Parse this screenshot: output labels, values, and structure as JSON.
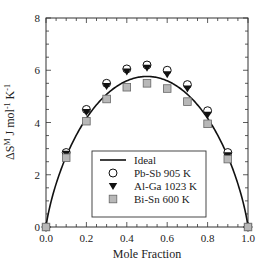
{
  "chart_data": {
    "type": "scatter",
    "title": "",
    "xlabel": "Mole Fraction",
    "ylabel": "ΔS^M J mol^-1 K^-1",
    "ylabel_parts": {
      "delta_s": "ΔS",
      "sup_m": "M",
      "unit": " J mol",
      "sup_1": "-1",
      "unit_k": " K",
      "sup_2": "-1"
    },
    "xlim": [
      0.0,
      1.0
    ],
    "ylim": [
      0,
      8
    ],
    "x_ticks": [
      "0.0",
      "0.2",
      "0.4",
      "0.6",
      "0.8",
      "1.0"
    ],
    "y_ticks": [
      "0",
      "2",
      "4",
      "6",
      "8"
    ],
    "grid": false,
    "legend_position": "lower center (inside)",
    "x": [
      0.0,
      0.1,
      0.2,
      0.3,
      0.4,
      0.5,
      0.6,
      0.7,
      0.8,
      0.9,
      1.0
    ],
    "series": [
      {
        "name": "Ideal",
        "type": "line",
        "formula": "-R[x ln x + (1-x) ln(1-x)]",
        "color": "#111111"
      },
      {
        "name": "Pb-Sb 905 K",
        "marker": "open-circle",
        "values": [
          0.0,
          2.85,
          4.5,
          5.5,
          6.05,
          6.2,
          6.0,
          5.45,
          4.45,
          2.85,
          0.0
        ]
      },
      {
        "name": "Al-Ga 1023 K",
        "marker": "filled-down-triangle",
        "values": [
          0.0,
          2.8,
          4.4,
          5.4,
          5.95,
          6.1,
          5.85,
          5.3,
          4.3,
          2.75,
          0.0
        ]
      },
      {
        "name": "Bi-Sn 600 K",
        "marker": "gray-square",
        "values": [
          0.0,
          2.65,
          4.05,
          4.9,
          5.35,
          5.5,
          5.3,
          4.8,
          3.95,
          2.6,
          0.0
        ]
      }
    ]
  },
  "legend": {
    "items": [
      "Ideal",
      "Pb-Sb 905 K",
      "Al-Ga 1023 K",
      "Bi-Sn 600 K"
    ]
  },
  "colors": {
    "line": "#111111",
    "square_fill": "#b8b8b8",
    "square_stroke": "#666666"
  }
}
